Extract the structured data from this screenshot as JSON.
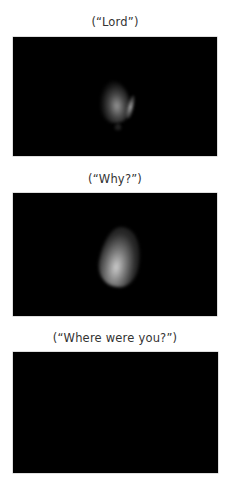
{
  "panels": [
    {
      "caption": "(“Lord”)",
      "flame": "dim-flame"
    },
    {
      "caption": "(“Why?”)",
      "flame": "bright-flame"
    },
    {
      "caption": "(“Where were you?”)",
      "flame": "none"
    }
  ],
  "colors": {
    "background": "#ffffff",
    "panel": "#000000",
    "caption_text": "#333333"
  }
}
